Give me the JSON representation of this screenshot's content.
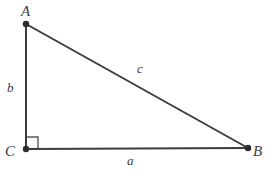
{
  "figure": {
    "kind": "right-triangle-diagram",
    "background_color": "#ffffff",
    "stroke_color": "#3c3c3c",
    "vertices": [
      {
        "id": "A",
        "label": "A",
        "x": 26,
        "y": 24
      },
      {
        "id": "B",
        "label": "B",
        "x": 248,
        "y": 148
      },
      {
        "id": "C",
        "label": "C",
        "x": 26,
        "y": 149
      }
    ],
    "sides": [
      {
        "id": "a",
        "label": "a",
        "from": "C",
        "to": "B",
        "role": "base-leg"
      },
      {
        "id": "b",
        "label": "b",
        "from": "C",
        "to": "A",
        "role": "vertical-leg"
      },
      {
        "id": "c",
        "label": "c",
        "from": "A",
        "to": "B",
        "role": "hypotenuse"
      }
    ],
    "right_angle": {
      "at": "C",
      "marker": "square",
      "size": 12
    },
    "labels": {
      "vertex_A": "A",
      "vertex_B": "B",
      "vertex_C": "C",
      "side_a": "a",
      "side_b": "b",
      "side_c": "c"
    }
  }
}
